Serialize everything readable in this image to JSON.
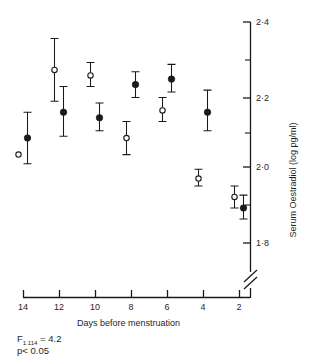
{
  "chart_data": {
    "type": "scatter",
    "title": "",
    "xlabel": "Days before menstruation",
    "ylabel": "Serum Oestradiol (log pg/ml)",
    "xlim": [
      15,
      0.6
    ],
    "ylim": [
      1.72,
      2.41
    ],
    "x_ticks": [
      14,
      12,
      10,
      8,
      6,
      4,
      2
    ],
    "x_tick_labels": [
      "14",
      "12",
      "10",
      "8",
      "6",
      "4",
      "2"
    ],
    "y_ticks": [
      2.4,
      2.2,
      2.0,
      1.8
    ],
    "y_tick_labels": [
      "2·4",
      "2·2",
      "2·0",
      "1·8"
    ],
    "y_minor_ticks": [
      2.3,
      2.1,
      1.9
    ],
    "grid": false,
    "legend_position": "none",
    "y_axis_break": true,
    "x_axis_direction": "decreasing",
    "error_bar_type": "sem",
    "series": [
      {
        "name": "filled-circle-group",
        "marker": "filled-circle",
        "x": [
          14,
          12,
          10,
          8,
          6,
          4,
          2
        ],
        "y": [
          2.085,
          2.155,
          2.14,
          2.23,
          2.245,
          2.155,
          1.895
        ],
        "err_low": [
          2.015,
          2.09,
          2.105,
          2.195,
          2.21,
          2.105,
          1.865
        ],
        "err_high": [
          2.155,
          2.225,
          2.18,
          2.265,
          2.285,
          2.215,
          1.93
        ]
      },
      {
        "name": "open-circle-group",
        "marker": "open-circle",
        "x": [
          14,
          12,
          10,
          8,
          6,
          4,
          2
        ],
        "y": [
          2.04,
          2.27,
          2.255,
          2.085,
          2.16,
          1.975,
          1.925
        ],
        "err_low": [
          2.04,
          2.185,
          2.225,
          2.04,
          2.13,
          1.955,
          1.895
        ],
        "err_high": [
          2.04,
          2.355,
          2.29,
          2.13,
          2.195,
          2.0,
          1.955
        ]
      }
    ],
    "annotations": [
      {
        "name": "f-statistic",
        "text_main": "F",
        "text_sub": "1.114",
        "text_tail": " = 4.2"
      },
      {
        "name": "p-value",
        "text": "p< 0.05"
      }
    ],
    "colors": {
      "axis": "#1a1a1a",
      "marker_filled": "#1a1a1a",
      "marker_open": "#ffffff",
      "background": "#ffffff"
    }
  }
}
